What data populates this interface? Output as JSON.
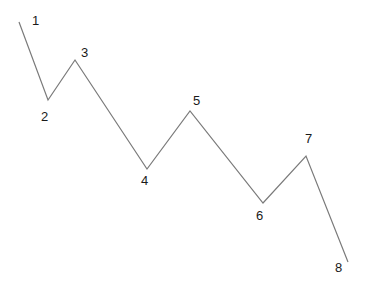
{
  "diagram": {
    "type": "zigzag-wave",
    "line_color": "#7a7a7a",
    "label_color": "#1a1a1a",
    "points": [
      {
        "label": "1",
        "x": 19,
        "y": 22,
        "lx": 32,
        "ly": 25
      },
      {
        "label": "2",
        "x": 48,
        "y": 100,
        "lx": 41,
        "ly": 121
      },
      {
        "label": "3",
        "x": 75,
        "y": 60,
        "lx": 81,
        "ly": 57
      },
      {
        "label": "4",
        "x": 147,
        "y": 169,
        "lx": 141,
        "ly": 185
      },
      {
        "label": "5",
        "x": 190,
        "y": 111,
        "lx": 193,
        "ly": 105
      },
      {
        "label": "6",
        "x": 263,
        "y": 203,
        "lx": 256,
        "ly": 220
      },
      {
        "label": "7",
        "x": 306,
        "y": 156,
        "lx": 305,
        "ly": 143
      },
      {
        "label": "8",
        "x": 348,
        "y": 262,
        "lx": 335,
        "ly": 272
      }
    ]
  }
}
